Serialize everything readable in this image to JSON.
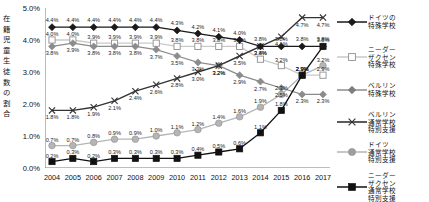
{
  "axis": {
    "y_title": "在籍児童生徒数の割合",
    "y_title_chars": [
      "在",
      "籍",
      "児",
      "童",
      "生",
      "徒",
      "数",
      "の",
      "割",
      "合"
    ],
    "y_ticks": [
      "5.0%",
      "4.0%",
      "3.0%",
      "2.0%",
      "1.0%",
      "0.0%"
    ],
    "x_ticks": [
      "2004",
      "2005",
      "2006",
      "2007",
      "2008",
      "2009",
      "2010",
      "2011",
      "2012",
      "2013",
      "2014",
      "2015",
      "2016",
      "2017"
    ]
  },
  "legend": {
    "items": [
      {
        "name": "ドイツの特殊学校",
        "lines": [
          "ドイツの",
          "特殊学校"
        ],
        "marker": "diamond",
        "fill": "#1a1a1a",
        "line": "#1a1a1a"
      },
      {
        "name": "ニーダーザクセン特殊学校",
        "lines": [
          "ニーダー",
          "ザクセン",
          "特殊学校"
        ],
        "marker": "square-open",
        "fill": "#ffffff",
        "line": "#c9c9c9"
      },
      {
        "name": "ベルリン特殊学校",
        "lines": [
          "ベルリン",
          "特殊学校"
        ],
        "marker": "diamond",
        "fill": "#7d7d7d",
        "line": "#8c8c8c"
      },
      {
        "name": "ベルリン通常学校特別支援",
        "lines": [
          "ベルリン",
          "通常学校",
          "特別支援"
        ],
        "marker": "x",
        "fill": "#333333",
        "line": "#333333"
      },
      {
        "name": "ドイツ通常学校特別支援",
        "lines": [
          "ドイツ",
          "通常学校",
          "特別支援"
        ],
        "marker": "circle",
        "fill": "#9e9e9e",
        "line": "#b5b5b5"
      },
      {
        "name": "ニーダーザクセン通常学校特別支援",
        "lines": [
          "ニーダー",
          "ザクセン",
          "通常学校",
          "特別支援"
        ],
        "marker": "square",
        "fill": "#111111",
        "line": "#111111"
      }
    ]
  },
  "chart_data": {
    "type": "line",
    "title": "",
    "xlabel": "",
    "ylabel": "在籍児童生徒数の割合",
    "ylim": [
      0,
      5
    ],
    "ytick_step": 1,
    "grid": false,
    "legend_position": "right",
    "x": [
      "2004",
      "2005",
      "2006",
      "2007",
      "2008",
      "2009",
      "2010",
      "2011",
      "2012",
      "2013",
      "2014",
      "2015",
      "2016",
      "2017"
    ],
    "series": [
      {
        "name": "ドイツの特殊学校",
        "marker": "diamond",
        "color": "#1a1a1a",
        "values": [
          4.4,
          4.4,
          4.4,
          4.4,
          4.4,
          4.4,
          4.3,
          4.2,
          4.1,
          4.0,
          3.8,
          3.8,
          3.8,
          3.8
        ],
        "labels": [
          "4.4%",
          "4.4%",
          "4.4%",
          "4.4%",
          "4.4%",
          "4.4%",
          "4.3%",
          "4.2%",
          "4.1%",
          "4.0%",
          "3.8%",
          "3.8%",
          "3.8%",
          "3.8%"
        ]
      },
      {
        "name": "ニーダーザクセン特殊学校",
        "marker": "square-open",
        "color": "#c9c9c9",
        "values": [
          4.0,
          4.0,
          3.9,
          3.9,
          3.9,
          3.9,
          3.8,
          3.8,
          3.8,
          3.8,
          3.4,
          3.2,
          2.9,
          2.9
        ],
        "labels": [
          "4.0%",
          "4.0%",
          "3.9%",
          "3.9%",
          "3.9%",
          "3.9%",
          "3.8%",
          "3.8%",
          "3.8%",
          "3.8%",
          "3.4%",
          "3.2%",
          "2.9%",
          "2.9%"
        ]
      },
      {
        "name": "ベルリン特殊学校",
        "marker": "diamond",
        "color": "#8c8c8c",
        "values": [
          3.8,
          3.9,
          3.8,
          3.8,
          3.8,
          3.7,
          3.5,
          3.3,
          3.2,
          2.9,
          2.7,
          2.5,
          2.3,
          2.3
        ],
        "labels": [
          "3.8%",
          "3.9%",
          "3.8%",
          "3.8%",
          "3.8%",
          "3.7%",
          "3.5%",
          "3.3%",
          "3.2%",
          "2.9%",
          "2.7%",
          "2.5%",
          "2.3%",
          "2.3%"
        ]
      },
      {
        "name": "ベルリン通常学校特別支援",
        "marker": "x",
        "color": "#333333",
        "values": [
          1.8,
          1.8,
          1.9,
          2.1,
          2.4,
          2.6,
          2.8,
          3.0,
          3.2,
          3.5,
          3.8,
          4.1,
          4.7,
          4.7
        ],
        "labels": [
          "1.8%",
          "1.8%",
          "1.9%",
          "2.1%",
          "2.4%",
          "2.6%",
          "2.8%",
          "3.0%",
          "3.2%",
          "3.5%",
          "3.8%",
          "4.1%",
          "4.7%",
          "4.7%"
        ]
      },
      {
        "name": "ドイツ通常学校特別支援",
        "marker": "circle",
        "color": "#b5b5b5",
        "values": [
          0.7,
          0.7,
          0.8,
          0.9,
          0.9,
          1.0,
          1.1,
          1.2,
          1.4,
          1.6,
          1.9,
          2.3,
          2.9,
          3.2
        ],
        "labels": [
          "0.7%",
          "0.7%",
          "0.8%",
          "0.9%",
          "0.9%",
          "1.0%",
          "1.1%",
          "1.2%",
          "1.4%",
          "1.6%",
          "1.9%",
          "2.3%",
          "2.9%",
          "3.2%"
        ]
      },
      {
        "name": "ニーダーザクセン通常学校特別支援",
        "marker": "square",
        "color": "#111111",
        "values": [
          0.2,
          0.3,
          0.2,
          0.3,
          0.3,
          0.3,
          0.3,
          0.4,
          0.5,
          0.6,
          1.1,
          1.8,
          2.9,
          3.8
        ],
        "labels": [
          "0.2%",
          "0.3%",
          "0.2%",
          "0.3%",
          "0.3%",
          "0.3%",
          "0.3%",
          "0.4%",
          "0.5%",
          "0.6%",
          "1.1%",
          "1.8%",
          "2.9%",
          "3.8%"
        ]
      }
    ]
  },
  "label_offsets": {
    "ドイツの特殊学校": -7,
    "ニーダーザクセン特殊学校": -6,
    "ベルリン特殊学校": 7,
    "ベルリン通常学校特別支援": 7,
    "ドイツ通常学校特別支援": -6,
    "ニーダーザクセン通常学校特別支援": -6
  }
}
